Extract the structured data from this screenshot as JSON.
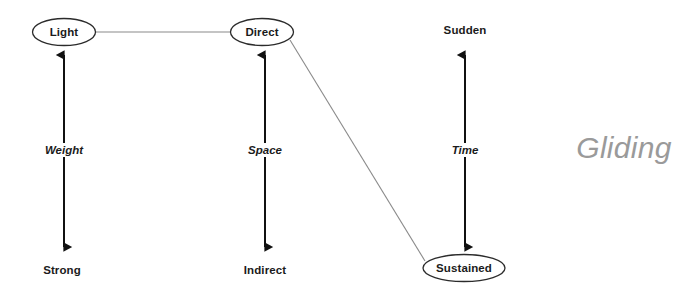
{
  "diagram": {
    "effort_name": "Gliding",
    "nodes": [
      {
        "id": "light",
        "label": "Light",
        "shape": "ellipse",
        "x": 64,
        "y": 32
      },
      {
        "id": "direct",
        "label": "Direct",
        "shape": "ellipse",
        "x": 262,
        "y": 32
      },
      {
        "id": "sudden",
        "label": "Sudden",
        "shape": "text",
        "x": 465,
        "y": 30
      },
      {
        "id": "strong",
        "label": "Strong",
        "shape": "text",
        "x": 62,
        "y": 270
      },
      {
        "id": "indirect",
        "label": "Indirect",
        "shape": "text",
        "x": 265,
        "y": 270
      },
      {
        "id": "sustained",
        "label": "Sustained",
        "shape": "ellipse",
        "x": 464,
        "y": 268
      }
    ],
    "axes": [
      {
        "id": "weight",
        "label": "Weight",
        "x": 64,
        "top": 55,
        "bottom": 247,
        "label_y": 150
      },
      {
        "id": "space",
        "label": "Space",
        "x": 265,
        "top": 55,
        "bottom": 247,
        "label_y": 150
      },
      {
        "id": "time",
        "label": "Time",
        "x": 465,
        "top": 55,
        "bottom": 247,
        "label_y": 150
      }
    ],
    "connections": [
      {
        "id": "light-direct",
        "from": "Light",
        "to": "Direct",
        "x1": 96,
        "y1": 32,
        "x2": 231,
        "y2": 32
      },
      {
        "id": "direct-sustained",
        "from": "Direct",
        "to": "Sustained",
        "x1": 290,
        "y1": 40,
        "x2": 425,
        "y2": 261
      }
    ],
    "colors": {
      "text": "#1b1b1b",
      "arrow": "#111111",
      "connector": "#8a8a8a",
      "ellipse_stroke": "#2b2b2b",
      "watermark": "#9a9a9a",
      "background": "#ffffff"
    },
    "watermark": {
      "text": "Gliding",
      "x": 624,
      "y": 148
    }
  }
}
